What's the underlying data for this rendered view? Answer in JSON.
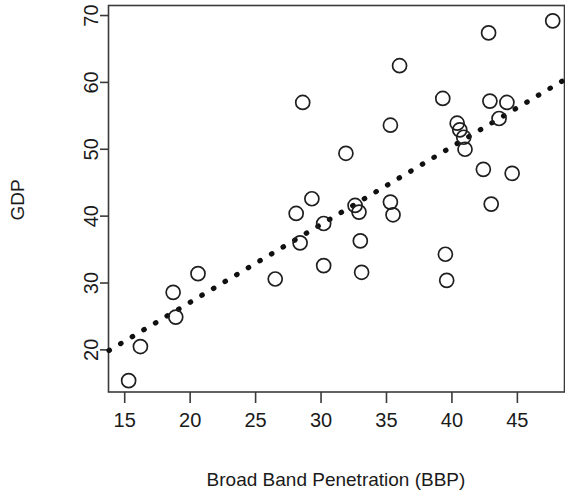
{
  "chart_data": {
    "type": "scatter",
    "title": "",
    "xlabel": "Broad Band Penetration (BBP)",
    "ylabel": "GDP",
    "xlim": [
      13.8,
      48.6
    ],
    "ylim": [
      13.7,
      71.5
    ],
    "xticks": [
      15,
      20,
      25,
      30,
      35,
      40,
      45
    ],
    "yticks": [
      20,
      30,
      40,
      50,
      60,
      70
    ],
    "xtick_labels": [
      "15",
      "20",
      "25",
      "30",
      "35",
      "40",
      "45"
    ],
    "ytick_labels": [
      "20",
      "30",
      "40",
      "50",
      "60",
      "70"
    ],
    "grid": false,
    "legend": null,
    "marker": "open-circle",
    "points": [
      {
        "x": 15.3,
        "y": 15.4
      },
      {
        "x": 16.2,
        "y": 20.5
      },
      {
        "x": 18.7,
        "y": 28.6
      },
      {
        "x": 18.9,
        "y": 24.9
      },
      {
        "x": 20.6,
        "y": 31.4
      },
      {
        "x": 26.5,
        "y": 30.6
      },
      {
        "x": 28.1,
        "y": 40.4
      },
      {
        "x": 28.4,
        "y": 36.0
      },
      {
        "x": 28.6,
        "y": 57.0
      },
      {
        "x": 29.3,
        "y": 42.6
      },
      {
        "x": 30.2,
        "y": 38.9
      },
      {
        "x": 30.2,
        "y": 32.6
      },
      {
        "x": 31.9,
        "y": 49.4
      },
      {
        "x": 32.6,
        "y": 41.6
      },
      {
        "x": 32.9,
        "y": 40.6
      },
      {
        "x": 33.0,
        "y": 36.3
      },
      {
        "x": 33.1,
        "y": 31.6
      },
      {
        "x": 35.3,
        "y": 53.6
      },
      {
        "x": 35.3,
        "y": 42.1
      },
      {
        "x": 35.5,
        "y": 40.2
      },
      {
        "x": 36.0,
        "y": 62.5
      },
      {
        "x": 39.3,
        "y": 57.6
      },
      {
        "x": 39.5,
        "y": 34.3
      },
      {
        "x": 39.6,
        "y": 30.4
      },
      {
        "x": 40.4,
        "y": 53.9
      },
      {
        "x": 40.6,
        "y": 52.9
      },
      {
        "x": 40.9,
        "y": 51.8
      },
      {
        "x": 41.0,
        "y": 50.0
      },
      {
        "x": 42.4,
        "y": 47.0
      },
      {
        "x": 42.8,
        "y": 67.4
      },
      {
        "x": 42.9,
        "y": 57.2
      },
      {
        "x": 43.0,
        "y": 41.8
      },
      {
        "x": 43.6,
        "y": 54.6
      },
      {
        "x": 44.2,
        "y": 57.0
      },
      {
        "x": 44.6,
        "y": 46.4
      },
      {
        "x": 47.7,
        "y": 69.2
      }
    ],
    "trend_line": {
      "style": "dashed",
      "x_start": 13.8,
      "y_start": 19.9,
      "x_end": 48.6,
      "y_end": 60.4
    }
  }
}
